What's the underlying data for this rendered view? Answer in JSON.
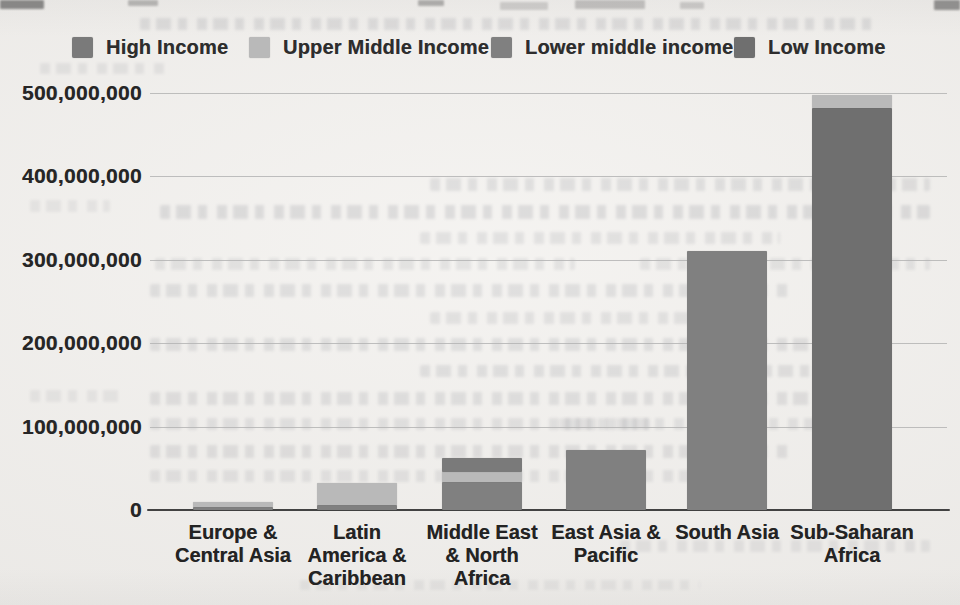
{
  "page": {
    "background_color": "#f1efec"
  },
  "chart_data": {
    "type": "bar",
    "stacked": true,
    "title": "",
    "xlabel": "",
    "ylabel": "",
    "ylim": [
      0,
      500000000
    ],
    "grid": true,
    "legend_position": "top",
    "categories": [
      "Europe & Central Asia",
      "Latin America & Caribbean",
      "Middle East & North Africa",
      "East Asia & Pacific",
      "South Asia",
      "Sub-Saharan Africa"
    ],
    "category_labels_wrapped": [
      "Europe &\nCentral Asia",
      "Latin\nAmerica &\nCaribbean",
      "Middle East\n& North\nAfrica",
      "East Asia &\nPacific",
      "South Asia",
      "Sub-Saharan\nAfrica"
    ],
    "yticks": [
      {
        "value": 500000000,
        "label": "500,000,000"
      },
      {
        "value": 400000000,
        "label": "400,000,000"
      },
      {
        "value": 300000000,
        "label": "300,000,000"
      },
      {
        "value": 200000000,
        "label": "200,000,000"
      },
      {
        "value": 100000000,
        "label": "100,000,000"
      },
      {
        "value": 0,
        "label": "0"
      }
    ],
    "series": [
      {
        "name": "High Income",
        "color": "#7a7a7a",
        "values": [
          0,
          0,
          16000000,
          0,
          0,
          0
        ]
      },
      {
        "name": "Upper Middle Income",
        "color": "#b9b9b9",
        "values": [
          7000000,
          26000000,
          12000000,
          0,
          0,
          16000000
        ]
      },
      {
        "name": "Lower middle income",
        "color": "#808080",
        "values": [
          3000000,
          6000000,
          34000000,
          72000000,
          310000000,
          0
        ]
      },
      {
        "name": "Low Income",
        "color": "#6f6f6f",
        "values": [
          0,
          0,
          0,
          0,
          0,
          482000000
        ]
      }
    ],
    "stack_order_bottom_to_top": [
      "Low Income",
      "Lower middle income",
      "Upper Middle Income",
      "High Income"
    ]
  }
}
